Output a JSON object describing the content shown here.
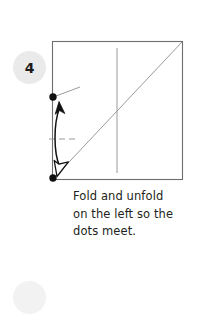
{
  "page": {
    "background_color": "#ffffff",
    "width": 197,
    "height": 287
  },
  "step": {
    "number": "4",
    "badge_color": "#eaeaea",
    "badge_text_color": "#1b1b1b"
  },
  "next_step": {
    "badge_color": "#f2f2f2"
  },
  "caption": {
    "line1": "Fold and unfold",
    "line2": "on the left so the",
    "line3": "dots meet.",
    "full_text": "Fold and unfold on the left so the dots meet.",
    "text_color": "#231f20"
  },
  "diagram": {
    "type": "origami-step-diagram",
    "paper": {
      "shape": "square",
      "left": 52,
      "top": 41,
      "right": 183,
      "bottom": 180,
      "edge_color": "#6e6e6e",
      "fill_color": "#ffffff"
    },
    "crease_lines": [
      {
        "name": "vertical-crease",
        "style": "solid-thin",
        "color": "#8a8a8a",
        "x1": 117,
        "y1": 48,
        "x2": 117,
        "y2": 173
      },
      {
        "name": "diagonal-crease",
        "style": "solid-thin",
        "color": "#8a8a8a",
        "x1": 54,
        "y1": 178,
        "x2": 182,
        "y2": 42
      }
    ],
    "dots": [
      {
        "name": "upper-left-dot",
        "cx": 53,
        "cy": 97,
        "r": 3.6,
        "color": "#111111"
      },
      {
        "name": "lower-left-dot",
        "cx": 53,
        "cy": 178,
        "r": 3.6,
        "color": "#111111"
      }
    ],
    "reference_marks": [
      {
        "name": "corner-tick",
        "style": "solid-thin",
        "color": "#8a8a8a",
        "x1": 55,
        "y1": 96,
        "x2": 80,
        "y2": 87
      },
      {
        "name": "midpoint-dashes",
        "style": "dashed",
        "color": "#8a8a8a",
        "x1": 49,
        "y1": 139,
        "x2": 79,
        "y2": 139
      }
    ],
    "arrow": {
      "name": "fold-and-unfold-arrow",
      "style": "double-headed-curved",
      "head_up": "solid",
      "head_down": "hollow",
      "color": "#111111",
      "from": {
        "x": 57,
        "cy": 172
      },
      "to": {
        "x": 57,
        "cy": 104
      }
    }
  }
}
